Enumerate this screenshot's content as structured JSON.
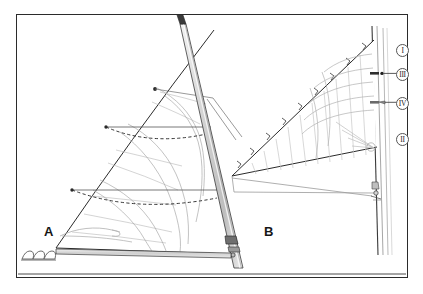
{
  "figure": {
    "kind": "technical-line-drawing",
    "panels": [
      {
        "id": "A",
        "label": "A",
        "description": "mainsail with reef lines on mast and boom"
      },
      {
        "id": "B",
        "label": "B",
        "description": "headsail on forestay with hanks and panel seams"
      }
    ],
    "callouts": [
      {
        "label": "I",
        "target": "masthead-area"
      },
      {
        "label": "III",
        "target": "upper-mast-fitting"
      },
      {
        "label": "IV",
        "target": "mid-mast-fitting"
      },
      {
        "label": "II",
        "target": "lower-stay-area"
      }
    ],
    "colors": {
      "frame": "#2b2b2b",
      "ink_dark": "#1d1d1d",
      "ink_mid": "#6e6e6e",
      "ink_light": "#b4b4b4",
      "spar_fill": "#d8d8d8",
      "paper": "#ffffff"
    }
  }
}
